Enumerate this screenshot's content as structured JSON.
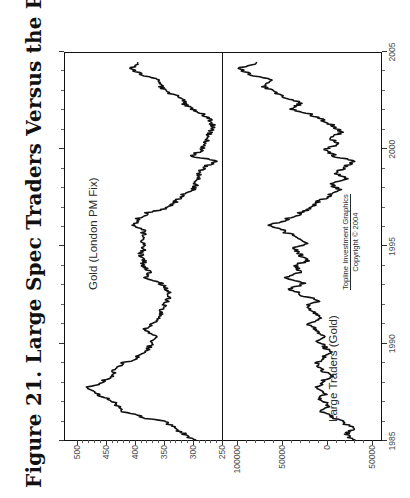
{
  "figure": {
    "title": "Figure 21. Large Spec Traders Versus the Price of Gold",
    "credit_line_1": "Topline Investment Graphics",
    "credit_line_2": "Copyright © 2004"
  },
  "chart_data": [
    {
      "type": "line",
      "panel": "top",
      "title": "Gold (London PM Fix)",
      "series_label": "Gold (London PM Fix)",
      "xlabel": "",
      "ylabel": "",
      "grid": false,
      "legend": "inside-top-left",
      "xlim": [
        1985,
        2005
      ],
      "ylim": [
        250,
        520
      ],
      "yticks": [
        500,
        450,
        400,
        350,
        300,
        250
      ],
      "ytick_labels": [
        "500",
        "450",
        "400",
        "350",
        "300",
        "250"
      ],
      "xticks": [
        1985,
        1990,
        1995,
        2000,
        2005
      ],
      "xtick_labels": [
        "1985",
        "1990",
        "1995",
        "2000",
        "2005"
      ],
      "x": [
        1985.0,
        1985.3,
        1985.6,
        1985.9,
        1986.2,
        1986.5,
        1986.8,
        1987.1,
        1987.4,
        1987.7,
        1988.0,
        1988.3,
        1988.6,
        1988.9,
        1989.2,
        1989.5,
        1989.8,
        1990.1,
        1990.4,
        1990.7,
        1991.0,
        1991.3,
        1991.6,
        1991.9,
        1992.2,
        1992.5,
        1992.8,
        1993.1,
        1993.4,
        1993.7,
        1994.0,
        1994.3,
        1994.6,
        1994.9,
        1995.2,
        1995.5,
        1995.8,
        1996.1,
        1996.4,
        1996.7,
        1997.0,
        1997.3,
        1997.6,
        1997.9,
        1998.2,
        1998.5,
        1998.8,
        1999.1,
        1999.4,
        1999.7,
        2000.0,
        2000.3,
        2000.6,
        2000.9,
        2001.2,
        2001.5,
        2001.8,
        2002.1,
        2002.4,
        2002.7,
        2003.0,
        2003.3,
        2003.6,
        2003.9,
        2004.2,
        2004.5
      ],
      "y": [
        300,
        315,
        330,
        345,
        390,
        420,
        430,
        445,
        465,
        480,
        455,
        440,
        435,
        425,
        400,
        385,
        375,
        370,
        365,
        385,
        370,
        360,
        355,
        350,
        345,
        340,
        345,
        355,
        380,
        375,
        385,
        385,
        390,
        385,
        385,
        385,
        385,
        400,
        395,
        380,
        345,
        330,
        320,
        300,
        295,
        290,
        290,
        280,
        260,
        300,
        285,
        280,
        275,
        270,
        265,
        270,
        280,
        300,
        315,
        320,
        345,
        355,
        360,
        390,
        405,
        395
      ],
      "units": "US$ per ounce"
    },
    {
      "type": "line",
      "panel": "bottom",
      "title": "Large Traders (Gold)",
      "series_label": "Large Traders (Gold)",
      "xlabel": "",
      "ylabel": "",
      "grid": false,
      "legend": "inside-bottom-left",
      "xlim": [
        1985,
        2005
      ],
      "ylim": [
        -60000,
        115000
      ],
      "yticks": [
        100000,
        50000,
        0,
        -50000
      ],
      "ytick_labels": [
        "100000",
        "50000",
        "0",
        "50000"
      ],
      "xticks": [
        1985,
        1990,
        1995,
        2000,
        2005
      ],
      "xtick_labels": [
        "1985",
        "1990",
        "1995",
        "2000",
        "2005"
      ],
      "x": [
        1985.0,
        1985.3,
        1985.6,
        1985.9,
        1986.2,
        1986.5,
        1986.8,
        1987.1,
        1987.4,
        1987.7,
        1988.0,
        1988.3,
        1988.6,
        1988.9,
        1989.2,
        1989.5,
        1989.8,
        1990.1,
        1990.4,
        1990.7,
        1991.0,
        1991.3,
        1991.6,
        1991.9,
        1992.2,
        1992.5,
        1992.8,
        1993.1,
        1993.4,
        1993.7,
        1994.0,
        1994.3,
        1994.6,
        1994.9,
        1995.2,
        1995.5,
        1995.8,
        1996.1,
        1996.4,
        1996.7,
        1997.0,
        1997.3,
        1997.6,
        1997.9,
        1998.2,
        1998.5,
        1998.8,
        1999.1,
        1999.4,
        1999.7,
        2000.0,
        2000.3,
        2000.6,
        2000.9,
        2001.2,
        2001.5,
        2001.8,
        2002.1,
        2002.4,
        2002.7,
        2003.0,
        2003.3,
        2003.6,
        2003.9,
        2004.2,
        2004.5
      ],
      "y": [
        -28000,
        -22000,
        -30000,
        -18000,
        -5000,
        5000,
        -2000,
        8000,
        2000,
        10000,
        5000,
        -5000,
        4000,
        12000,
        6000,
        -4000,
        2000,
        10000,
        4000,
        14000,
        20000,
        8000,
        14000,
        22000,
        10000,
        28000,
        40000,
        26000,
        44000,
        30000,
        34000,
        22000,
        30000,
        36000,
        22000,
        34000,
        48000,
        62000,
        44000,
        30000,
        18000,
        10000,
        -2000,
        -14000,
        -6000,
        -22000,
        -10000,
        -20000,
        -30000,
        -8000,
        2000,
        -12000,
        -4000,
        -16000,
        -8000,
        4000,
        16000,
        38000,
        30000,
        46000,
        58000,
        70000,
        62000,
        86000,
        96000,
        78000
      ],
      "units": "contracts (net position)"
    }
  ]
}
